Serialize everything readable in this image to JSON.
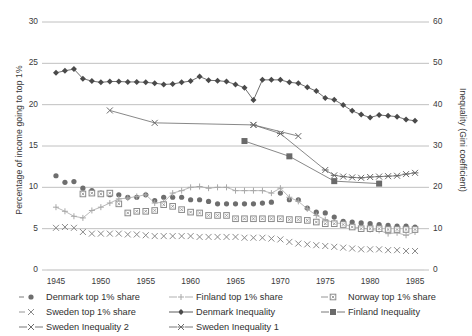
{
  "chart_data": {
    "type": "line",
    "title": "",
    "xlabel": "",
    "ylabel": "Percentage of income going to top 1%",
    "ylabel_right": "Inequality (Gini coefficient)",
    "xlim": [
      1944,
      1986
    ],
    "ylim": [
      0,
      30
    ],
    "ylim_right": [
      0,
      60
    ],
    "grid": true,
    "legend_position": "below-axis",
    "xticks": [
      "1945",
      "1950",
      "1955",
      "1960",
      "1965",
      "1970",
      "1975",
      "1980",
      "1985"
    ],
    "xtick_values": [
      1945,
      1950,
      1955,
      1960,
      1965,
      1970,
      1975,
      1980,
      1985
    ],
    "yticks_left": [
      "0",
      "5",
      "10",
      "15",
      "20",
      "25",
      "30"
    ],
    "ytick_values_left": [
      0,
      5,
      10,
      15,
      20,
      25,
      30
    ],
    "yticks_right": [
      "0",
      "10",
      "20",
      "30",
      "40",
      "50",
      "60"
    ],
    "ytick_values_right": [
      0,
      10,
      20,
      30,
      40,
      50,
      60
    ],
    "series": [
      {
        "name": "Denmark top 1% share",
        "axis": "left",
        "marker": "circle",
        "color": "#6e6e6e",
        "line": false,
        "x": [
          1945,
          1946,
          1947,
          1948,
          1949,
          1950,
          1951,
          1952,
          1953,
          1954,
          1955,
          1956,
          1957,
          1958,
          1959,
          1960,
          1961,
          1962,
          1963,
          1964,
          1965,
          1966,
          1967,
          1968,
          1969,
          1970,
          1971,
          1972,
          1973,
          1974,
          1975,
          1976,
          1977,
          1978,
          1979,
          1980,
          1981,
          1982,
          1983,
          1984,
          1985
        ],
        "values": [
          11.4,
          10.6,
          10.7,
          9.9,
          9.6,
          9.3,
          9.1,
          9.1,
          8.8,
          8.8,
          9.1,
          8.4,
          8.8,
          8.8,
          8.8,
          8.5,
          8.5,
          8.3,
          8.0,
          8.0,
          8.0,
          8.0,
          8.0,
          8.1,
          8.2,
          9.3,
          8.5,
          8.5,
          7.5,
          7.0,
          6.9,
          6.4,
          5.9,
          5.8,
          5.7,
          5.6,
          5.5,
          5.4,
          5.3,
          5.3,
          5.2
        ]
      },
      {
        "name": "Finland top 1% share",
        "axis": "left",
        "marker": "plus",
        "color": "#a8a8a8",
        "line": true,
        "x": [
          1945,
          1946,
          1947,
          1948,
          1949,
          1950,
          1951,
          1952,
          1953,
          1954,
          1955,
          1956,
          1957,
          1958,
          1959,
          1960,
          1961,
          1962,
          1963,
          1964,
          1965,
          1966,
          1967,
          1968,
          1969,
          1970,
          1971,
          1972,
          1973,
          1974,
          1975,
          1976,
          1977,
          1978,
          1979,
          1980,
          1981,
          1982,
          1983,
          1984,
          1985
        ],
        "values": [
          7.6,
          7.1,
          6.5,
          6.3,
          7.2,
          7.6,
          8.1,
          8.6,
          8.7,
          8.9,
          9.1,
          8.1,
          8.2,
          9.3,
          9.6,
          10.0,
          10.1,
          9.9,
          10.0,
          10.0,
          9.6,
          9.6,
          9.6,
          9.6,
          9.3,
          9.9,
          8.8,
          8.3,
          7.4,
          6.6,
          6.1,
          5.7,
          5.6,
          5.2,
          5.1,
          4.9,
          4.8,
          4.4,
          4.5,
          4.2,
          4.6
        ]
      },
      {
        "name": "Norway top 1% share",
        "axis": "left",
        "marker": "square-open",
        "color": "#8a8a8a",
        "line": false,
        "x": [
          1948,
          1949,
          1950,
          1951,
          1952,
          1953,
          1954,
          1955,
          1956,
          1957,
          1958,
          1959,
          1960,
          1961,
          1962,
          1963,
          1964,
          1965,
          1966,
          1967,
          1968,
          1969,
          1970,
          1971,
          1972,
          1973,
          1974,
          1975,
          1976,
          1977,
          1978,
          1979,
          1980,
          1981,
          1982,
          1983,
          1984,
          1985
        ],
        "values": [
          9.2,
          9.3,
          9.2,
          9.3,
          8.0,
          6.9,
          7.1,
          7.1,
          7.2,
          7.9,
          7.7,
          7.3,
          7.0,
          6.9,
          6.6,
          6.6,
          6.6,
          6.2,
          6.2,
          6.2,
          6.2,
          6.2,
          6.2,
          6.1,
          6.1,
          6.0,
          5.8,
          5.6,
          5.6,
          5.5,
          5.2,
          5.0,
          5.0,
          5.0,
          4.9,
          4.9,
          4.9,
          4.9
        ]
      },
      {
        "name": "Sweden top 1% share",
        "axis": "left",
        "marker": "x",
        "color": "#8a8a8a",
        "line": false,
        "x": [
          1945,
          1946,
          1947,
          1948,
          1949,
          1950,
          1951,
          1952,
          1953,
          1954,
          1955,
          1956,
          1957,
          1958,
          1959,
          1960,
          1961,
          1962,
          1963,
          1964,
          1965,
          1966,
          1967,
          1968,
          1969,
          1970,
          1971,
          1972,
          1973,
          1974,
          1975,
          1976,
          1977,
          1978,
          1979,
          1980,
          1981,
          1982,
          1983,
          1984,
          1985
        ],
        "values": [
          5.1,
          5.2,
          5.1,
          4.6,
          4.4,
          4.4,
          4.4,
          4.4,
          4.3,
          4.3,
          4.2,
          4.1,
          4.1,
          4.1,
          4.1,
          4.1,
          4.0,
          4.0,
          4.0,
          4.0,
          4.0,
          3.9,
          3.9,
          3.9,
          3.8,
          3.7,
          3.4,
          3.2,
          3.1,
          3.0,
          2.9,
          2.8,
          2.7,
          2.6,
          2.5,
          2.5,
          2.5,
          2.4,
          2.4,
          2.3,
          2.3
        ]
      },
      {
        "name": "Denmark Inequality",
        "axis": "right",
        "marker": "diamond",
        "color": "#4a4a4a",
        "line": true,
        "x": [
          1945,
          1946,
          1947,
          1948,
          1949,
          1950,
          1951,
          1952,
          1953,
          1954,
          1955,
          1956,
          1957,
          1958,
          1959,
          1960,
          1961,
          1962,
          1963,
          1964,
          1965,
          1966,
          1967,
          1968,
          1969,
          1970,
          1971,
          1972,
          1973,
          1974,
          1975,
          1976,
          1977,
          1978,
          1979,
          1980,
          1981,
          1982,
          1983,
          1984,
          1985
        ],
        "values": [
          47.7,
          48.2,
          48.6,
          46.3,
          45.7,
          45.4,
          45.6,
          45.6,
          45.5,
          45.5,
          45.4,
          45.2,
          44.9,
          45.0,
          45.4,
          45.7,
          46.8,
          45.9,
          45.8,
          45.6,
          44.9,
          44.1,
          41.1,
          46.0,
          46.0,
          46.0,
          45.4,
          45.2,
          44.2,
          43.3,
          41.6,
          41.2,
          39.9,
          38.5,
          37.6,
          36.9,
          37.5,
          37.3,
          37.1,
          36.4,
          36.1
        ]
      },
      {
        "name": "Finland Inequality",
        "axis": "right",
        "marker": "square-filled",
        "color": "#6a6a6a",
        "line": true,
        "x": [
          1966,
          1971,
          1976,
          1981
        ],
        "values": [
          31.2,
          27.5,
          21.5,
          20.9
        ]
      },
      {
        "name": "Sweden Inequality 2",
        "axis": "right",
        "marker": "x-line",
        "color": "#6a6a6a",
        "line": true,
        "x": [
          1951,
          1956,
          1967,
          1972
        ],
        "values": [
          38.6,
          35.6,
          35.1,
          32.4
        ]
      },
      {
        "name": "Sweden Inequality 1",
        "axis": "right",
        "marker": "asterisk",
        "color": "#6a6a6a",
        "line": true,
        "x": [
          1967,
          1970,
          1975,
          1976,
          1977,
          1978,
          1979,
          1980,
          1981,
          1982,
          1983,
          1984,
          1985
        ],
        "values": [
          35.1,
          33.0,
          24.2,
          22.9,
          22.6,
          22.4,
          22.3,
          22.5,
          22.6,
          22.7,
          22.8,
          23.2,
          23.5
        ]
      }
    ]
  },
  "legend": {
    "rows": [
      [
        {
          "label": "Denmark top 1% share",
          "marker": "circle",
          "color": "#6e6e6e"
        },
        {
          "label": "Finland top 1% share",
          "marker": "plus",
          "color": "#a8a8a8"
        },
        {
          "label": "Norway top 1% share",
          "marker": "square-open",
          "color": "#8a8a8a"
        }
      ],
      [
        {
          "label": "Sweden top 1% share",
          "marker": "x",
          "color": "#8a8a8a"
        },
        {
          "label": "Denmark Inequality",
          "marker": "diamond",
          "color": "#4a4a4a"
        },
        {
          "label": "Finland Inequality",
          "marker": "square-filled",
          "color": "#6a6a6a"
        }
      ],
      [
        {
          "label": "Sweden Inequality 2",
          "marker": "x-line",
          "color": "#6a6a6a"
        },
        {
          "label": "Sweden Inequality 1",
          "marker": "asterisk",
          "color": "#6a6a6a"
        }
      ]
    ]
  },
  "colors": {
    "grid": "#b9b9b9",
    "text": "#3a3a3a",
    "background": "#ffffff"
  }
}
